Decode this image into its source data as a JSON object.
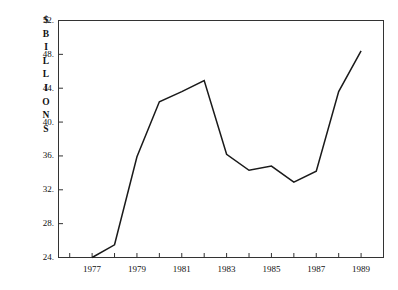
{
  "chart_data": {
    "type": "line",
    "title": "",
    "subtitle": "",
    "xlabel": "",
    "ylabel": "$ BILLIONS",
    "ylabel_chars": [
      "$",
      "B",
      "I",
      "L",
      "L",
      "I",
      "O",
      "N",
      "S"
    ],
    "x": [
      1977,
      1978,
      1979,
      1980,
      1981,
      1982,
      1983,
      1984,
      1985,
      1986,
      1987,
      1988,
      1989
    ],
    "values": [
      24.0,
      25.5,
      35.9,
      42.4,
      43.6,
      44.9,
      36.2,
      34.3,
      34.8,
      32.9,
      34.2,
      43.6,
      48.4
    ],
    "series": [
      {
        "name": "$ Billions",
        "values": [
          24.0,
          25.5,
          35.9,
          42.4,
          43.6,
          44.9,
          36.2,
          34.3,
          34.8,
          32.9,
          34.2,
          43.6,
          48.4
        ]
      }
    ],
    "xlim": [
      1975.5,
      1990.0
    ],
    "ylim": [
      24,
      52
    ],
    "ytick_values": [
      24,
      28,
      32,
      36,
      40,
      44,
      48,
      52
    ],
    "ytick_labels": [
      "24.",
      "28.",
      "32.",
      "36.",
      "40.",
      "44.",
      "48.",
      "52."
    ],
    "xtick_values": [
      1976,
      1977,
      1978,
      1979,
      1980,
      1981,
      1982,
      1983,
      1984,
      1985,
      1986,
      1987,
      1988,
      1989
    ],
    "xtick_labeled_values": [
      1977,
      1979,
      1981,
      1983,
      1985,
      1987,
      1989
    ],
    "xtick_labels": [
      "1977",
      "1979",
      "1981",
      "1983",
      "1985",
      "1987",
      "1989"
    ],
    "grid": false,
    "legend": "none",
    "line_color": "#1a1a1a",
    "axis_color": "#333333",
    "background_color": "#ffffff"
  }
}
